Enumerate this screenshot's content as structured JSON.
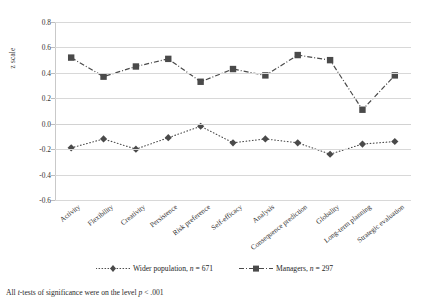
{
  "chart_data": {
    "type": "line",
    "title": "",
    "xlabel": "",
    "ylabel": "z scale",
    "ylim": [
      -0.6,
      0.8
    ],
    "ytick_step": 0.2,
    "yticks": [
      "0.8",
      "0.6",
      "0.4",
      "0.2",
      "0.0",
      "-0.2",
      "-0.4",
      "-0.6"
    ],
    "grid": true,
    "legend_position": "bottom-center",
    "categories": [
      "Activity",
      "Flexibility",
      "Creativity",
      "Persistence",
      "Risk preference",
      "Self-efficacy",
      "Analysis",
      "Consequence prediction",
      "Globality",
      "Long-term planning",
      "Strategic evaluation"
    ],
    "series": [
      {
        "name": "Wider population",
        "legend_label": "Wider population, n = 671",
        "n": 671,
        "marker": "diamond",
        "line_style": "dotted",
        "color": "#4a4a4a",
        "values": [
          -0.19,
          -0.12,
          -0.2,
          -0.11,
          -0.02,
          -0.15,
          -0.12,
          -0.15,
          -0.24,
          -0.16,
          -0.14
        ]
      },
      {
        "name": "Managers",
        "legend_label": "Managers, n = 297",
        "n": 297,
        "marker": "square",
        "line_style": "dash-dot",
        "color": "#4a4a4a",
        "values": [
          0.52,
          0.37,
          0.45,
          0.51,
          0.33,
          0.43,
          0.38,
          0.54,
          0.5,
          0.11,
          0.38
        ]
      }
    ]
  },
  "axis": {
    "y_title": "z scale"
  },
  "legend": {
    "items": [
      {
        "label_main": "Wider population,",
        "label_stat": "n",
        "label_value": "= 671"
      },
      {
        "label_main": "Managers,",
        "label_stat": "n",
        "label_value": "= 297"
      }
    ]
  },
  "footnote": {
    "prefix": "All",
    "italic1": "t",
    "middle": "-tests of significance were on the level",
    "italic2": "p",
    "suffix": "< .001"
  },
  "colors": {
    "marker": "#4a4a4a",
    "line": "#5a5a5a",
    "grid": "#d8d8d8",
    "text": "#2b2b2b",
    "background": "#ffffff"
  }
}
